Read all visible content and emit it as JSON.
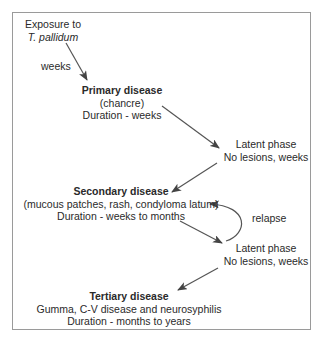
{
  "diagram": {
    "colors": {
      "text": "#2a2a2a",
      "arrow": "#555555",
      "frame": "#9a9a9a",
      "background": "#ffffff"
    },
    "nodes": {
      "exposure": {
        "line1": "Exposure to",
        "line2": "T. pallidum"
      },
      "primary": {
        "title": "Primary disease",
        "line2": "(chancre)",
        "line3": "Duration - weeks"
      },
      "latent1": {
        "line1": "Latent phase",
        "line2": "No lesions, weeks"
      },
      "secondary": {
        "title": "Secondary disease",
        "line2": "(mucous patches, rash, condyloma latum)",
        "line3": "Duration - weeks to months"
      },
      "latent2": {
        "line1": "Latent phase",
        "line2": "No lesions, weeks"
      },
      "tertiary": {
        "title": "Tertiary disease",
        "line2": "Gumma, C-V disease and neurosyphilis",
        "line3": "Duration - months to years"
      }
    },
    "edge_labels": {
      "exposure_to_primary": "weeks",
      "relapse": "relapse"
    },
    "edges": [
      {
        "from": "exposure",
        "to": "primary",
        "label": "weeks"
      },
      {
        "from": "primary",
        "to": "latent1"
      },
      {
        "from": "latent1",
        "to": "secondary"
      },
      {
        "from": "secondary",
        "to": "latent2"
      },
      {
        "from": "latent2",
        "to": "secondary",
        "label": "relapse",
        "curved": true
      },
      {
        "from": "latent2",
        "to": "tertiary"
      }
    ]
  }
}
